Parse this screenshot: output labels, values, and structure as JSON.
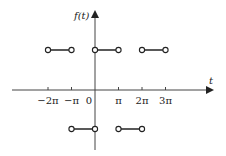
{
  "chart_data": {
    "type": "line",
    "title": "",
    "xlabel": "t",
    "ylabel": "f(t)",
    "x_tick_labels": [
      "−2π",
      "−π",
      "0",
      "π",
      "2π",
      "3π"
    ],
    "x_tick_values": [
      -2,
      -1,
      0,
      1,
      2,
      3
    ],
    "x_units": "π",
    "levels": {
      "high": 1,
      "low": -1
    },
    "segments": [
      {
        "x_start": -2,
        "x_end": -1,
        "y": 1,
        "endpoints": "open"
      },
      {
        "x_start": 0,
        "x_end": 1,
        "y": 1,
        "endpoints": "open"
      },
      {
        "x_start": 2,
        "x_end": 3,
        "y": 1,
        "endpoints": "open"
      },
      {
        "x_start": -1,
        "x_end": 0,
        "y": -1,
        "endpoints": "open"
      },
      {
        "x_start": 1,
        "x_end": 2,
        "y": -1,
        "endpoints": "open"
      }
    ],
    "grid": false,
    "legend": null
  },
  "labels": {
    "y_axis": "f(t)",
    "x_axis": "t",
    "ticks": [
      "−2π",
      "−π",
      "0",
      "π",
      "2π",
      "3π"
    ]
  },
  "colors": {
    "axis": "#333333",
    "line": "#222222",
    "marker_fill": "#ffffff"
  }
}
